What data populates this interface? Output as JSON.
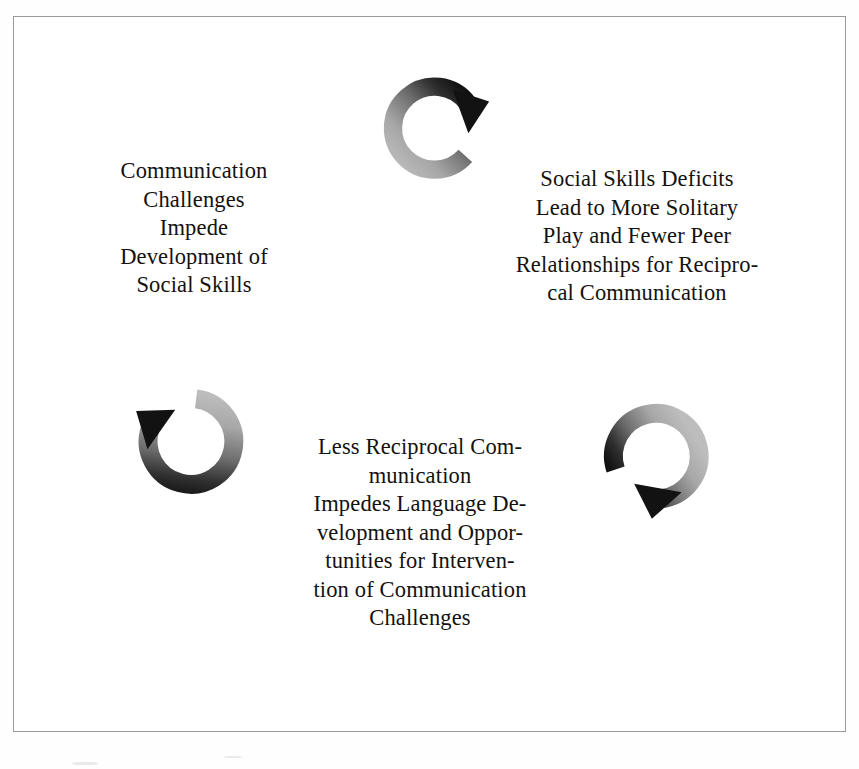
{
  "figure": {
    "type": "cyclical-process-diagram",
    "node_count": 3,
    "arrow_count": 3,
    "frame_border_color": "#9a9a9a",
    "background_color": "#ffffff",
    "text_color": "#14110f"
  },
  "nodes": [
    {
      "id": "communication-challenges",
      "position": "upper-left",
      "text": "Communication\nChallenges\nImpede\nDevelopment of\nSocial Skills",
      "lines": [
        "Communication",
        "Challenges",
        "Impede",
        "Development of",
        "Social Skills"
      ]
    },
    {
      "id": "social-skills-deficits",
      "position": "upper-right",
      "text": "Social Skills Deficits\nLead to More Solitary\nPlay and Fewer Peer\nRelationships for Recipro-\ncal Communication",
      "lines": [
        "Social Skills Deficits",
        "Lead to More Solitary",
        "Play and Fewer Peer",
        "Relationships for Recipro-",
        "cal Communication"
      ]
    },
    {
      "id": "less-reciprocal-communication",
      "position": "bottom-center",
      "text": "Less Reciprocal Com-\nmunication\nImpedes Language De-\nvelopment and Oppor-\ntunities for Interven-\ntion of Communication\nChallenges",
      "lines": [
        "Less Reciprocal Com-",
        "munication",
        "Impedes Language De-",
        "velopment and Oppor-",
        "tunities for Interven-",
        "tion of Communication",
        "Challenges"
      ]
    }
  ],
  "arrows": [
    {
      "id": "arrow-top",
      "icon": "circular-arrow-icon",
      "position": "top-center",
      "direction": "clockwise",
      "head_points": "down-right",
      "gradient_from": "#b3b3b3",
      "gradient_to": "#141414"
    },
    {
      "id": "arrow-left",
      "icon": "circular-arrow-icon",
      "position": "bottom-left",
      "direction": "clockwise",
      "head_points": "up-left",
      "gradient_from": "#b3b3b3",
      "gradient_to": "#141414"
    },
    {
      "id": "arrow-right",
      "icon": "circular-arrow-icon",
      "position": "bottom-right",
      "direction": "clockwise",
      "head_points": "down-left",
      "gradient_from": "#b3b3b3",
      "gradient_to": "#141414"
    }
  ]
}
